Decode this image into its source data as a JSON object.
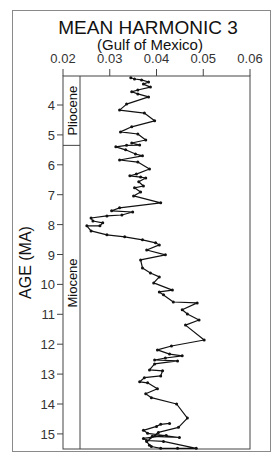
{
  "chart_data": {
    "type": "line",
    "title": "MEAN HARMONIC 3",
    "subtitle": "(Gulf of Mexico)",
    "xlabel": "",
    "ylabel": "AGE (MA)",
    "x_axis_position": "top",
    "xlim": [
      0.02,
      0.06
    ],
    "ylim": [
      3.0,
      15.5
    ],
    "y_inverted": true,
    "grid": false,
    "legend": null,
    "x_ticks": [
      "0.02",
      "0.03",
      "0.04",
      "0.05",
      "0.06"
    ],
    "y_ticks": [
      "4",
      "5",
      "6",
      "7",
      "8",
      "9",
      "10",
      "11",
      "12",
      "13",
      "14",
      "15"
    ],
    "epochs": [
      {
        "name": "Pliocene",
        "from_age": 3.0,
        "to_age": 5.35
      },
      {
        "name": "Miocene",
        "from_age": 5.35,
        "to_age": 15.5
      }
    ],
    "series": [
      {
        "name": "Mean Harmonic 3",
        "marker": "dot",
        "points": [
          {
            "age": 3.09,
            "value": 0.0345
          },
          {
            "age": 3.13,
            "value": 0.0353
          },
          {
            "age": 3.16,
            "value": 0.0368
          },
          {
            "age": 3.23,
            "value": 0.0383
          },
          {
            "age": 3.3,
            "value": 0.0372
          },
          {
            "age": 3.4,
            "value": 0.0387
          },
          {
            "age": 3.5,
            "value": 0.036
          },
          {
            "age": 3.56,
            "value": 0.0347
          },
          {
            "age": 3.63,
            "value": 0.036
          },
          {
            "age": 3.73,
            "value": 0.0383
          },
          {
            "age": 3.97,
            "value": 0.0336
          },
          {
            "age": 4.17,
            "value": 0.0321
          },
          {
            "age": 4.27,
            "value": 0.0374
          },
          {
            "age": 4.53,
            "value": 0.0396
          },
          {
            "age": 4.73,
            "value": 0.0347
          },
          {
            "age": 4.9,
            "value": 0.0323
          },
          {
            "age": 4.97,
            "value": 0.036
          },
          {
            "age": 5.17,
            "value": 0.0377
          },
          {
            "age": 5.27,
            "value": 0.0347
          },
          {
            "age": 5.34,
            "value": 0.0364
          },
          {
            "age": 5.35,
            "value": 0.0336
          },
          {
            "age": 5.4,
            "value": 0.0313
          },
          {
            "age": 5.5,
            "value": 0.0334
          },
          {
            "age": 5.64,
            "value": 0.0355
          },
          {
            "age": 5.7,
            "value": 0.037
          },
          {
            "age": 5.84,
            "value": 0.0321
          },
          {
            "age": 5.91,
            "value": 0.036
          },
          {
            "age": 6.14,
            "value": 0.0385
          },
          {
            "age": 6.31,
            "value": 0.0357
          },
          {
            "age": 6.37,
            "value": 0.0343
          },
          {
            "age": 6.41,
            "value": 0.0366
          },
          {
            "age": 6.44,
            "value": 0.0377
          },
          {
            "age": 6.57,
            "value": 0.0362
          },
          {
            "age": 6.71,
            "value": 0.0372
          },
          {
            "age": 6.77,
            "value": 0.0353
          },
          {
            "age": 6.91,
            "value": 0.0366
          },
          {
            "age": 7.04,
            "value": 0.0351
          },
          {
            "age": 7.27,
            "value": 0.0409
          },
          {
            "age": 7.44,
            "value": 0.0321
          },
          {
            "age": 7.54,
            "value": 0.0304
          },
          {
            "age": 7.58,
            "value": 0.0349
          },
          {
            "age": 7.68,
            "value": 0.0326
          },
          {
            "age": 7.71,
            "value": 0.0294
          },
          {
            "age": 7.78,
            "value": 0.026
          },
          {
            "age": 7.88,
            "value": 0.0264
          },
          {
            "age": 7.94,
            "value": 0.0285
          },
          {
            "age": 8.04,
            "value": 0.0279
          },
          {
            "age": 8.04,
            "value": 0.0251
          },
          {
            "age": 8.21,
            "value": 0.026
          },
          {
            "age": 8.34,
            "value": 0.0294
          },
          {
            "age": 8.41,
            "value": 0.0332
          },
          {
            "age": 8.51,
            "value": 0.037
          },
          {
            "age": 8.61,
            "value": 0.0398
          },
          {
            "age": 8.68,
            "value": 0.0406
          },
          {
            "age": 8.85,
            "value": 0.0379
          },
          {
            "age": 9.01,
            "value": 0.0419
          },
          {
            "age": 9.18,
            "value": 0.0366
          },
          {
            "age": 9.45,
            "value": 0.037
          },
          {
            "age": 9.62,
            "value": 0.0387
          },
          {
            "age": 9.75,
            "value": 0.0406
          },
          {
            "age": 9.95,
            "value": 0.0394
          },
          {
            "age": 10.19,
            "value": 0.0434
          },
          {
            "age": 10.25,
            "value": 0.0406
          },
          {
            "age": 10.35,
            "value": 0.0415
          },
          {
            "age": 10.59,
            "value": 0.0436
          },
          {
            "age": 10.62,
            "value": 0.0487
          },
          {
            "age": 10.85,
            "value": 0.0455
          },
          {
            "age": 10.99,
            "value": 0.0466
          },
          {
            "age": 11.19,
            "value": 0.0491
          },
          {
            "age": 11.36,
            "value": 0.0462
          },
          {
            "age": 11.86,
            "value": 0.0502
          },
          {
            "age": 12.06,
            "value": 0.0432
          },
          {
            "age": 12.19,
            "value": 0.0402
          },
          {
            "age": 12.33,
            "value": 0.0428
          },
          {
            "age": 12.39,
            "value": 0.0455
          },
          {
            "age": 12.46,
            "value": 0.0419
          },
          {
            "age": 12.53,
            "value": 0.0396
          },
          {
            "age": 12.56,
            "value": 0.0445
          },
          {
            "age": 12.66,
            "value": 0.0396
          },
          {
            "age": 12.86,
            "value": 0.0385
          },
          {
            "age": 12.89,
            "value": 0.0413
          },
          {
            "age": 13.06,
            "value": 0.0409
          },
          {
            "age": 13.12,
            "value": 0.0374
          },
          {
            "age": 13.26,
            "value": 0.0364
          },
          {
            "age": 13.29,
            "value": 0.0381
          },
          {
            "age": 13.49,
            "value": 0.0402
          },
          {
            "age": 13.66,
            "value": 0.0377
          },
          {
            "age": 13.79,
            "value": 0.0389
          },
          {
            "age": 14.0,
            "value": 0.0443
          },
          {
            "age": 14.47,
            "value": 0.0466
          },
          {
            "age": 14.78,
            "value": 0.0447
          },
          {
            "age": 14.95,
            "value": 0.0404
          },
          {
            "age": 15.25,
            "value": 0.0379
          },
          {
            "age": 15.38,
            "value": 0.0385
          },
          {
            "age": 15.42,
            "value": 0.0389
          },
          {
            "age": 15.48,
            "value": 0.0409
          },
          {
            "age": 15.48,
            "value": 0.0445
          },
          {
            "age": 15.48,
            "value": 0.0485
          },
          {
            "age": 15.25,
            "value": 0.0415
          },
          {
            "age": 15.22,
            "value": 0.0379
          },
          {
            "age": 15.15,
            "value": 0.0372
          },
          {
            "age": 15.05,
            "value": 0.0421
          },
          {
            "age": 15.08,
            "value": 0.0391
          },
          {
            "age": 15.12,
            "value": 0.0449
          },
          {
            "age": 14.98,
            "value": 0.0381
          },
          {
            "age": 14.88,
            "value": 0.0372
          },
          {
            "age": 14.75,
            "value": 0.04
          },
          {
            "age": 14.68,
            "value": 0.0409
          },
          {
            "age": 14.65,
            "value": 0.0428
          }
        ]
      }
    ]
  }
}
